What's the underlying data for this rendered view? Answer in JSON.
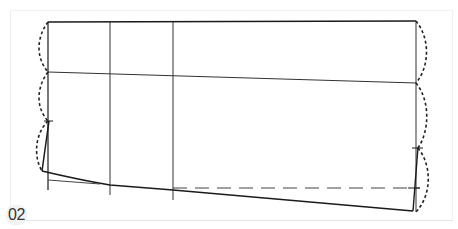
{
  "figure": {
    "label": "02",
    "colors": {
      "line": "#1a1a1a",
      "guide": "#444444",
      "dashed": "#333333",
      "panel_border": "#e6e6e6",
      "label_bg": "#f3f3f3"
    }
  }
}
